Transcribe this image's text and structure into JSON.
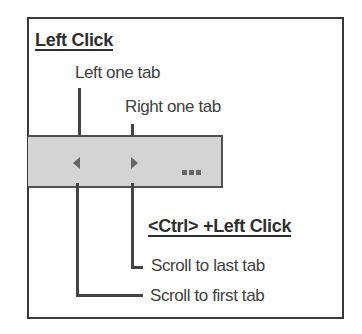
{
  "diagram": {
    "left_click": {
      "heading": "Left Click",
      "left_arrow_label": "Left one tab",
      "right_arrow_label": "Right one tab"
    },
    "ctrl_left_click": {
      "heading": "<Ctrl> +Left Click",
      "right_arrow_label": "Scroll to last tab",
      "left_arrow_label": "Scroll to first tab"
    },
    "tab_bar": {
      "left_icon": "triangle-left",
      "right_icon": "triangle-right",
      "overflow": "..."
    },
    "colors": {
      "bar_fill": "#d4d4d4",
      "lines": "#444444",
      "text": "#404040"
    }
  }
}
